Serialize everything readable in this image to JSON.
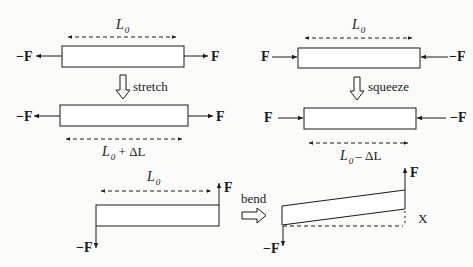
{
  "diagram": {
    "panels": [
      {
        "id": "stretch",
        "before": {
          "length_label": "L",
          "length_sub": "0",
          "left_force": "−F",
          "right_force": "F"
        },
        "action": "stretch",
        "after": {
          "length_label": "L",
          "length_sub": "0",
          "length_suffix": " + ΔL",
          "left_force": "−F",
          "right_force": "F"
        }
      },
      {
        "id": "squeeze",
        "before": {
          "length_label": "L",
          "length_sub": "0",
          "left_force": "F",
          "right_force": "−F"
        },
        "action": "squeeze",
        "after": {
          "length_label": "L",
          "length_sub": "0",
          "length_suffix": "– ΔL",
          "left_force": "F",
          "right_force": "−F"
        }
      },
      {
        "id": "bend",
        "before": {
          "length_label": "L",
          "length_sub": "0",
          "up_force": "F",
          "down_force": "−F"
        },
        "action": "bend",
        "after": {
          "up_force": "F",
          "down_force": "−F",
          "deflection_label": "X"
        }
      }
    ],
    "colors": {
      "line": "#1a1a1a",
      "background": "#fbfbfa",
      "bar_fill": "#ffffff"
    }
  }
}
